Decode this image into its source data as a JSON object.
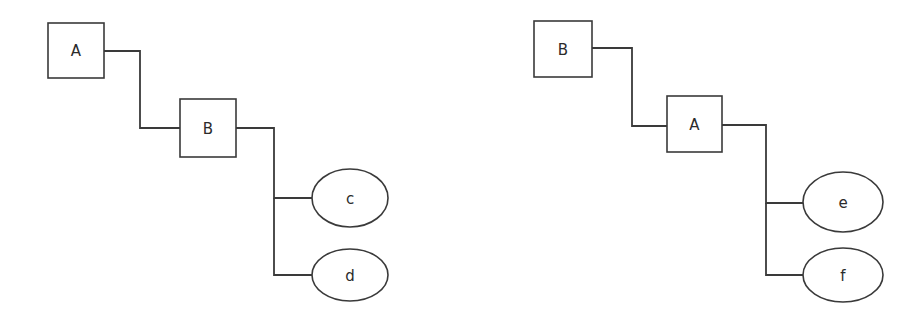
{
  "diagram": {
    "type": "tree-diagram-pair",
    "background_color": "#ffffff",
    "stroke_color": "#3a3a3a",
    "fill_color": "#ffffff",
    "label_color": "#2b2b2b",
    "trees": [
      {
        "name": "left-tree",
        "root": {
          "id": "left-a",
          "label": "A",
          "shape": "rectangle",
          "x": 48,
          "y": 23,
          "width": 56,
          "height": 55
        },
        "nodes": [
          {
            "id": "left-b",
            "label": "B",
            "shape": "rectangle",
            "x": 180,
            "y": 99,
            "width": 56,
            "height": 58
          },
          {
            "id": "left-c",
            "label": "c",
            "shape": "ellipse",
            "cx": 350,
            "cy": 198,
            "rx": 38,
            "ry": 29
          },
          {
            "id": "left-d",
            "label": "d",
            "shape": "ellipse",
            "cx": 350,
            "cy": 275,
            "rx": 38,
            "ry": 26
          }
        ],
        "edges": [
          {
            "id": "left-edge-a-b",
            "from": "left-a",
            "to": "left-b",
            "path": "M104,51 L140,51 L140,128 L180,128"
          },
          {
            "id": "left-edge-b-c",
            "from": "left-b",
            "to": "left-c",
            "path": "M236,128 L274,128 L274,198 L312,198"
          },
          {
            "id": "left-edge-b-d",
            "from": "left-b",
            "to": "left-d",
            "path": "M274,198 L274,275 L312,275"
          }
        ]
      },
      {
        "name": "right-tree",
        "root": {
          "id": "right-b",
          "label": "B",
          "shape": "rectangle",
          "x": 534,
          "y": 21,
          "width": 58,
          "height": 56
        },
        "nodes": [
          {
            "id": "right-a",
            "label": "A",
            "shape": "rectangle",
            "x": 667,
            "y": 96,
            "width": 55,
            "height": 56
          },
          {
            "id": "right-e",
            "label": "e",
            "shape": "ellipse",
            "cx": 843,
            "cy": 202,
            "rx": 40,
            "ry": 30
          },
          {
            "id": "right-f",
            "label": "f",
            "shape": "ellipse",
            "cx": 843,
            "cy": 275,
            "rx": 40,
            "ry": 27
          }
        ],
        "edges": [
          {
            "id": "right-edge-b-a",
            "from": "right-b",
            "to": "right-a",
            "path": "M592,48 L632,48 L632,126 L667,126"
          },
          {
            "id": "right-edge-a-e",
            "from": "right-a",
            "to": "right-e",
            "path": "M722,125 L766,125 L766,203 L803,203"
          },
          {
            "id": "right-edge-a-f",
            "from": "right-a",
            "to": "right-f",
            "path": "M766,203 L766,275 L803,275"
          }
        ]
      }
    ]
  }
}
